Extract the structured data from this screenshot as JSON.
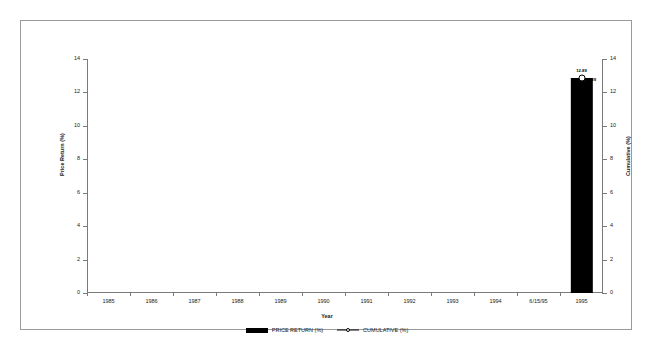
{
  "chart_data": {
    "type": "bar",
    "title": "",
    "xlabel": "Year",
    "ylabel": "Price Return (%)",
    "y2label": "Cumulative (%)",
    "categories": [
      "1985",
      "1986",
      "1987",
      "1988",
      "1989",
      "1990",
      "1991",
      "1992",
      "1993",
      "1994",
      "6/15/95",
      "1995"
    ],
    "ylim": [
      0,
      14
    ],
    "y2lim": [
      0,
      14
    ],
    "yticks": [
      0,
      2,
      4,
      6,
      8,
      10,
      12,
      14
    ],
    "yticklabels": [
      "0",
      "2",
      "4",
      "6",
      "8",
      "10",
      "12",
      "14"
    ],
    "y2ticks": [
      0,
      2,
      4,
      6,
      8,
      10,
      12,
      14
    ],
    "y2ticklabels": [
      "0",
      "2",
      "4",
      "6",
      "8",
      "10",
      "12",
      "14"
    ],
    "grid": false,
    "legend_position": "bottom",
    "series": [
      {
        "name": "PRICE RETURN (%)",
        "type": "bar",
        "color": "#000000",
        "values": [
          null,
          null,
          null,
          null,
          null,
          null,
          null,
          null,
          null,
          null,
          null,
          12.89
        ],
        "point_labels": [
          null,
          null,
          null,
          null,
          null,
          null,
          null,
          null,
          null,
          null,
          null,
          "12.89"
        ]
      },
      {
        "name": "CUMULATIVE (%)",
        "type": "line",
        "color": "#000000",
        "marker": "circle",
        "values": [
          null,
          null,
          null,
          null,
          null,
          null,
          null,
          null,
          null,
          null,
          null,
          12.89
        ],
        "point_labels": [
          null,
          null,
          null,
          null,
          null,
          null,
          null,
          null,
          null,
          null,
          null,
          "12.89"
        ]
      }
    ]
  },
  "legend": {
    "items": [
      {
        "label": "PRICE RETURN (%)",
        "swatch": "bar-swatch"
      },
      {
        "label": "CUMULATIVE (%)",
        "swatch": "line-marker-swatch"
      }
    ]
  }
}
